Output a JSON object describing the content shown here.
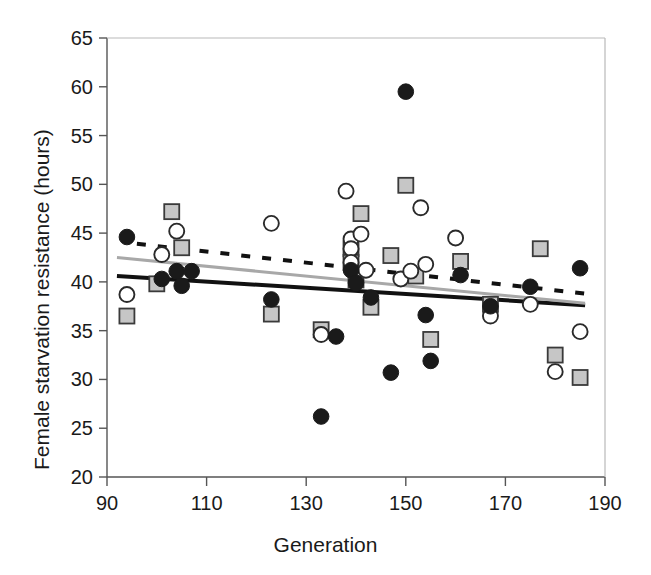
{
  "chart_data": {
    "type": "scatter",
    "title": "",
    "xlabel": "Generation",
    "ylabel": "Female starvation resistance (hours)",
    "xlim": [
      90,
      190
    ],
    "ylim": [
      20,
      65
    ],
    "xticks": [
      90,
      110,
      130,
      150,
      170,
      190
    ],
    "yticks": [
      20,
      25,
      30,
      35,
      40,
      45,
      50,
      55,
      60,
      65
    ],
    "grid": false,
    "legend": "none",
    "series": [
      {
        "name": "filled-circle",
        "marker": "filled-circle",
        "color": "#1a1a1a",
        "points": [
          [
            94,
            44.6
          ],
          [
            101,
            40.3
          ],
          [
            104,
            41.1
          ],
          [
            105,
            39.6
          ],
          [
            107,
            41.1
          ],
          [
            123,
            38.2
          ],
          [
            136,
            34.4
          ],
          [
            133,
            26.2
          ],
          [
            139,
            41.2
          ],
          [
            140,
            39.9
          ],
          [
            143,
            38.4
          ],
          [
            147,
            30.7
          ],
          [
            150,
            59.5
          ],
          [
            154,
            36.6
          ],
          [
            155,
            31.9
          ],
          [
            161,
            40.7
          ],
          [
            167,
            37.5
          ],
          [
            175,
            39.5
          ],
          [
            185,
            41.4
          ]
        ]
      },
      {
        "name": "open-circle",
        "marker": "open-circle",
        "color": "#1a1a1a",
        "points": [
          [
            94,
            38.7
          ],
          [
            101,
            42.8
          ],
          [
            104,
            45.2
          ],
          [
            123,
            46.0
          ],
          [
            133,
            34.6
          ],
          [
            138,
            49.3
          ],
          [
            139,
            44.4
          ],
          [
            139,
            43.4
          ],
          [
            141,
            44.9
          ],
          [
            139,
            42.0
          ],
          [
            142,
            41.2
          ],
          [
            149,
            40.3
          ],
          [
            151,
            41.1
          ],
          [
            153,
            47.6
          ],
          [
            154,
            41.8
          ],
          [
            160,
            44.5
          ],
          [
            167,
            36.5
          ],
          [
            175,
            37.7
          ],
          [
            180,
            30.8
          ],
          [
            185,
            34.9
          ]
        ]
      },
      {
        "name": "gray-square",
        "marker": "gray-square",
        "color": "#b0b0b0",
        "points": [
          [
            94,
            36.5
          ],
          [
            100,
            39.8
          ],
          [
            103,
            47.2
          ],
          [
            105,
            43.5
          ],
          [
            123,
            36.7
          ],
          [
            133,
            35.1
          ],
          [
            139,
            43.4
          ],
          [
            139,
            42.0
          ],
          [
            140,
            40.2
          ],
          [
            141,
            47.0
          ],
          [
            143,
            37.4
          ],
          [
            147,
            42.7
          ],
          [
            150,
            49.9
          ],
          [
            152,
            40.6
          ],
          [
            155,
            34.1
          ],
          [
            161,
            42.1
          ],
          [
            167,
            37.7
          ],
          [
            177,
            43.4
          ],
          [
            180,
            32.5
          ],
          [
            185,
            30.2
          ]
        ]
      }
    ],
    "trendlines": [
      {
        "name": "solid-black-trendline",
        "style": "solid",
        "color": "#111111",
        "width": 4,
        "x0": 92,
        "y0": 40.6,
        "x1": 186,
        "y1": 37.6
      },
      {
        "name": "solid-gray-trendline",
        "style": "solid",
        "color": "#a8a8a8",
        "width": 3,
        "x0": 92,
        "y0": 42.5,
        "x1": 186,
        "y1": 37.8
      },
      {
        "name": "dashed-black-trendline",
        "style": "dashed",
        "color": "#111111",
        "width": 4,
        "x0": 96,
        "y0": 43.9,
        "x1": 186,
        "y1": 38.8
      }
    ]
  }
}
